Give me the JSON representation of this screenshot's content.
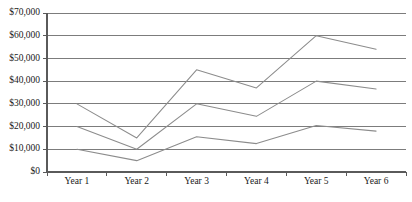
{
  "chart_data": {
    "type": "line",
    "title": "",
    "subtitle": "",
    "xlabel": "",
    "ylabel": "",
    "categories": [
      "Year 1",
      "Year 2",
      "Year 3",
      "Year 4",
      "Year 5",
      "Year 6"
    ],
    "ylim": [
      0,
      70000
    ],
    "ytick_values": [
      0,
      10000,
      20000,
      30000,
      40000,
      50000,
      60000,
      70000
    ],
    "ytick_labels": [
      "$0",
      "$10,000",
      "$20,000",
      "$30,000",
      "$40,000",
      "$50,000",
      "$60,000",
      "$70,000"
    ],
    "grid": "horizontal",
    "legend": "none",
    "markers": false,
    "line_color": "#8c8c8c",
    "grid_color": "#6e6e6e",
    "axis_color": "#5a5a5a",
    "text_color": "#1a1a1a",
    "background_color": "#ffffff",
    "series": [
      {
        "name": "series-1",
        "values": [
          30000,
          15000,
          45000,
          37000,
          60000,
          54000
        ]
      },
      {
        "name": "series-2",
        "values": [
          20000,
          10000,
          30000,
          24500,
          40000,
          36500
        ]
      },
      {
        "name": "series-3",
        "values": [
          10000,
          5000,
          15500,
          12500,
          20500,
          18000
        ]
      }
    ]
  },
  "layout": {
    "plot_left": 47,
    "plot_right": 406,
    "plot_top": 13,
    "plot_bottom": 172,
    "xtick_label_y": 178
  }
}
